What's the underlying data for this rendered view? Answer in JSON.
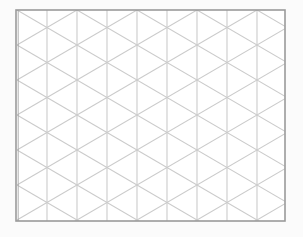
{
  "diagram": {
    "type": "isometric-triangle-grid",
    "columns": 9,
    "rows": 6,
    "line_color": "#cbcbcb",
    "border_color": "#9a9a9a",
    "background": "#fbfbfb"
  }
}
